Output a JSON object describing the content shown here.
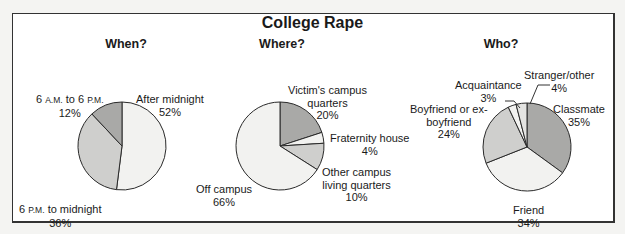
{
  "chart_data": [
    {
      "type": "pie",
      "title": "When?",
      "categories": [
        "After midnight",
        "6 P.M. to midnight",
        "6 A.M. to 6 P.M."
      ],
      "values": [
        52,
        36,
        12
      ],
      "unit": "%",
      "colors": [
        "#f2f2f0",
        "#cfcfcd",
        "#a9a9a7"
      ]
    },
    {
      "type": "pie",
      "title": "Where?",
      "categories": [
        "Victim's campus quarters",
        "Fraternity house",
        "Other campus living quarters",
        "Off campus"
      ],
      "values": [
        20,
        4,
        10,
        66
      ],
      "unit": "%",
      "colors": [
        "#a9a9a7",
        "#f2f2f0",
        "#cfcfcd",
        "#f2f2f0"
      ]
    },
    {
      "type": "pie",
      "title": "Who?",
      "categories": [
        "Classmate",
        "Friend",
        "Boyfriend or ex-boyfriend",
        "Acquaintance",
        "Stranger/other"
      ],
      "values": [
        35,
        34,
        24,
        3,
        4
      ],
      "unit": "%",
      "colors": [
        "#a9a9a7",
        "#f2f2f0",
        "#cfcfcd",
        "#f2f2f0",
        "#e4e4e2"
      ]
    }
  ],
  "header": {
    "title": "College Rape"
  },
  "sections": {
    "when": {
      "title": "When?",
      "labels": {
        "after_midnight": {
          "name": "After midnight",
          "pct": "52%"
        },
        "evening_num": "6",
        "evening_pm1": "P.M.",
        "evening_rest": "to midnight",
        "evening_pct": "36%",
        "day_num1": "6",
        "day_am": "A.M.",
        "day_to": "to 6",
        "day_pm": "P.M.",
        "day_pct": "12%"
      }
    },
    "where": {
      "title": "Where?",
      "labels": {
        "victim_l1": "Victim's campus",
        "victim_l2": "quarters",
        "victim_pct": "20%",
        "frat_name": "Fraternity house",
        "frat_pct": "4%",
        "other_l1": "Other campus",
        "other_l2": "living quarters",
        "other_pct": "10%",
        "off_name": "Off campus",
        "off_pct": "66%"
      }
    },
    "who": {
      "title": "Who?",
      "labels": {
        "stranger_name": "Stranger/other",
        "stranger_pct": "4%",
        "acq_name": "Acquaintance",
        "acq_pct": "3%",
        "bf_l1": "Boyfriend or ex-",
        "bf_l2": "boyfriend",
        "bf_pct": "24%",
        "classmate_name": "Classmate",
        "classmate_pct": "35%",
        "friend_name": "Friend",
        "friend_pct": "34%"
      }
    }
  }
}
